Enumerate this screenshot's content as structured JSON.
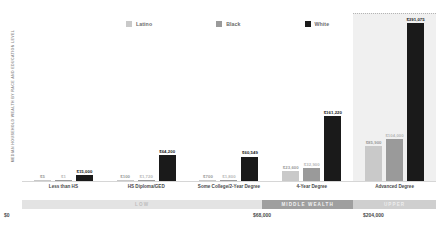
{
  "chart_data": {
    "type": "bar",
    "title": "",
    "ylabel": "MEDIAN HOUSEHOLD WEALTH BY RACE AND EDUCATION LEVEL",
    "xlabel": "",
    "grid": false,
    "legend_position": "top",
    "categories": [
      "Less than HS",
      "HS Diploma/GED",
      "Some College/2-Year Degree",
      "4-Year Degree",
      "Advanced Degree"
    ],
    "series": [
      {
        "name": "Latino",
        "color": "#c9c9c9",
        "values": [
          5,
          100,
          700,
          23600,
          85900
        ],
        "labels": [
          "$5",
          "$100",
          "$700",
          "$23,600",
          "$85,900"
        ]
      },
      {
        "name": "Black",
        "color": "#9a9a9a",
        "values": [
          1,
          1720,
          1800,
          32900,
          104000
        ],
        "labels": [
          "$1",
          "$1,720",
          "$1,800",
          "$32,900",
          "$104,000"
        ]
      },
      {
        "name": "White",
        "color": "#1a1a1a",
        "values": [
          15000,
          64200,
          60549,
          161220,
          391075
        ],
        "labels": [
          "$15,000",
          "$64,200",
          "$60,549",
          "$161,220",
          "$391,075"
        ]
      }
    ],
    "ylim": [
      0,
      391075
    ],
    "highlight_category": "Advanced Degree",
    "wealth_band": {
      "segments": [
        {
          "label": "Low",
          "color": "#e3e3e3",
          "text_color": "#bdbdbd"
        },
        {
          "label": "Middle Wealth",
          "color": "#9f9f9f",
          "text_color": "#f2f2f2"
        },
        {
          "label": "Upper",
          "color": "#cfcfcf",
          "text_color": "#ededed"
        }
      ],
      "ticks": [
        "$0",
        "$68,000",
        "$204,000"
      ]
    }
  }
}
